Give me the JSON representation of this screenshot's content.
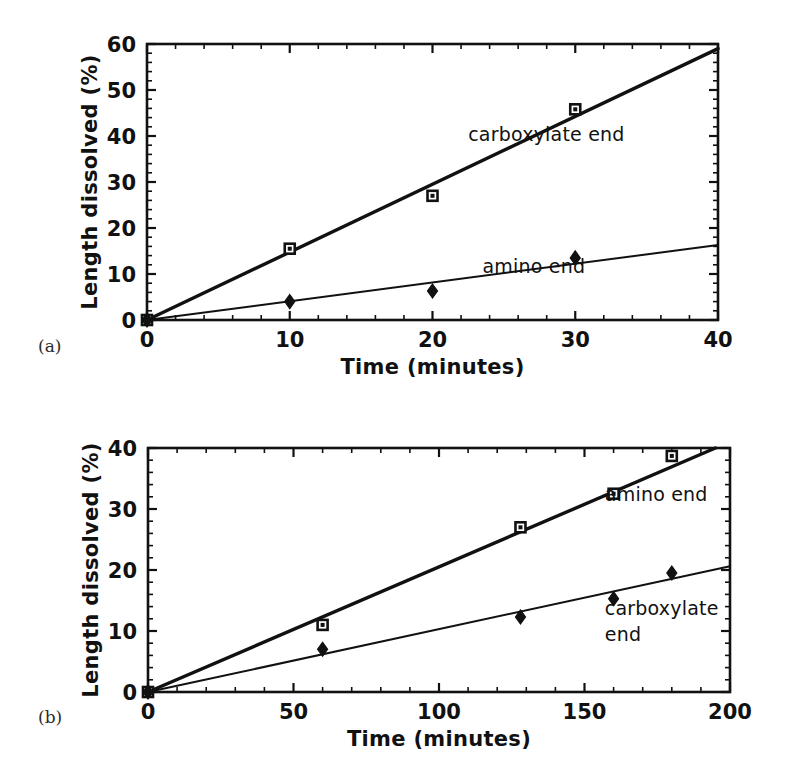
{
  "figure": {
    "panel_a_tag": "(a)",
    "panel_b_tag": "(b)"
  },
  "chart_data": [
    {
      "panel": "(a)",
      "type": "scatter",
      "title": "",
      "xlabel": "Time (minutes)",
      "ylabel": "Length dissolved (%)",
      "xlim": [
        0,
        40
      ],
      "ylim": [
        0,
        60
      ],
      "xticks": [
        0,
        10,
        20,
        30,
        40
      ],
      "xticklabels": [
        "0",
        "10",
        "20",
        "30",
        "40"
      ],
      "yticks": [
        0,
        10,
        20,
        30,
        40,
        50,
        60
      ],
      "yticklabels": [
        "0",
        "10",
        "20",
        "30",
        "40",
        "50",
        "60"
      ],
      "x_minor_interval": 2,
      "y_minor_interval": 2,
      "grid": false,
      "legend_position": "inline-annotation",
      "series": [
        {
          "name": "carboxylate end",
          "marker": "square",
          "annotation": "carboxylate end",
          "annotation_x": 22.5,
          "annotation_y": 39.0,
          "x": [
            0,
            10,
            20,
            30
          ],
          "y": [
            0,
            15.5,
            27.0,
            45.8
          ],
          "fit_line": {
            "x": [
              0,
              40
            ],
            "y": [
              0,
              59.0
            ],
            "slope": 1.475,
            "weight": "thick"
          }
        },
        {
          "name": "amino end",
          "marker": "diamond",
          "annotation": "amino end",
          "annotation_x": 23.5,
          "annotation_y": 10.3,
          "x": [
            0,
            10,
            20,
            30
          ],
          "y": [
            0,
            4.0,
            6.3,
            13.5
          ],
          "fit_line": {
            "x": [
              0,
              40
            ],
            "y": [
              0,
              16.3
            ],
            "slope": 0.4075,
            "weight": "thin"
          }
        }
      ]
    },
    {
      "panel": "(b)",
      "type": "scatter",
      "title": "",
      "xlabel": "Time (minutes)",
      "ylabel": "Length dissolved (%)",
      "xlim": [
        0,
        200
      ],
      "ylim": [
        0,
        40
      ],
      "xticks": [
        0,
        50,
        100,
        150,
        200
      ],
      "xticklabels": [
        "0",
        "50",
        "100",
        "150",
        "200"
      ],
      "yticks": [
        0,
        10,
        20,
        30,
        40
      ],
      "yticklabels": [
        "0",
        "10",
        "20",
        "30",
        "40"
      ],
      "x_minor_interval": 10,
      "y_minor_interval": 2,
      "grid": false,
      "legend_position": "inline-annotation",
      "series": [
        {
          "name": "amino end",
          "marker": "square",
          "annotation": "amino end",
          "annotation_x": 157,
          "annotation_y": 31.3,
          "x": [
            0,
            60,
            128,
            160,
            180
          ],
          "y": [
            0,
            11.0,
            27.0,
            32.5,
            38.7
          ],
          "fit_line": {
            "x": [
              0,
              195
            ],
            "y": [
              0,
              40.0
            ],
            "slope": 0.2051,
            "weight": "thick"
          }
        },
        {
          "name": "carboxylate end",
          "marker": "diamond",
          "annotation": "carboxylate end",
          "annotation_line1": "carboxylate",
          "annotation_line2": "end",
          "annotation_x": 157,
          "annotation_y": 12.7,
          "x": [
            0,
            60,
            128,
            160,
            180
          ],
          "y": [
            0,
            7.0,
            12.3,
            15.3,
            19.5
          ],
          "fit_line": {
            "x": [
              0,
              200
            ],
            "y": [
              0,
              20.6
            ],
            "slope": 0.103,
            "weight": "thin"
          }
        }
      ]
    }
  ]
}
